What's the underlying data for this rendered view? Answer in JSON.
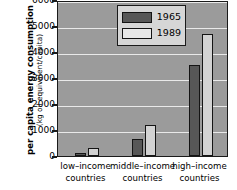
{
  "chart_data": {
    "type": "bar",
    "title": "",
    "xlabel": "",
    "ylabel": "per capita energy consumption",
    "ylabel_units": "(kg oil equivalent/capita)",
    "categories": [
      "low–income\ncountries",
      "middle–income\ncountries",
      "high–income\ncountries"
    ],
    "category_lines": [
      [
        "low–income",
        "countries"
      ],
      [
        "middle–income",
        "countries"
      ],
      [
        "high–income",
        "countries"
      ]
    ],
    "series": [
      {
        "name": "1965",
        "values": [
          120,
          650,
          3500
        ],
        "color": "#575757"
      },
      {
        "name": "1989",
        "values": [
          320,
          1180,
          4700
        ],
        "color": "#d2d2d2"
      }
    ],
    "ylim": [
      0,
      6000
    ],
    "yticks": [
      0,
      1000,
      2000,
      3000,
      4000,
      5000,
      6000
    ],
    "ytick_labels": [
      "0",
      "1000",
      "2000",
      "3000",
      "4000",
      "5000",
      "6000"
    ],
    "grid": true,
    "grid_color": "#e9e9e9",
    "legend_position": "top-left",
    "plot_background": "#9b9b9b",
    "axis_color": "#1a1a1a"
  },
  "legend": {
    "entries": [
      {
        "label": "1965"
      },
      {
        "label": "1989"
      }
    ]
  }
}
